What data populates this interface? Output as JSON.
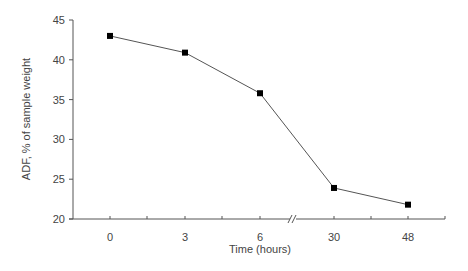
{
  "chart_data": {
    "type": "line",
    "title": "",
    "xlabel": "Time (hours)",
    "ylabel": "ADF, % of sample weight",
    "categories": [
      "0",
      "3",
      "6",
      "30",
      "48"
    ],
    "x": [
      0,
      3,
      6,
      30,
      48
    ],
    "series": [
      {
        "name": "ADF",
        "values": [
          43.0,
          40.9,
          35.8,
          23.9,
          21.8
        ],
        "marker": "square",
        "color": "#000000"
      }
    ],
    "ylim": [
      20,
      45
    ],
    "yticks": [
      20,
      25,
      30,
      35,
      40,
      45
    ],
    "xticks": [
      "0",
      "3",
      "6",
      "30",
      "48"
    ],
    "x_axis_break": "between 6 and 30",
    "grid": false,
    "legend": "none"
  },
  "colors": {
    "line": "#555555",
    "marker": "#000000",
    "axis": "#555555",
    "text": "#444444"
  }
}
